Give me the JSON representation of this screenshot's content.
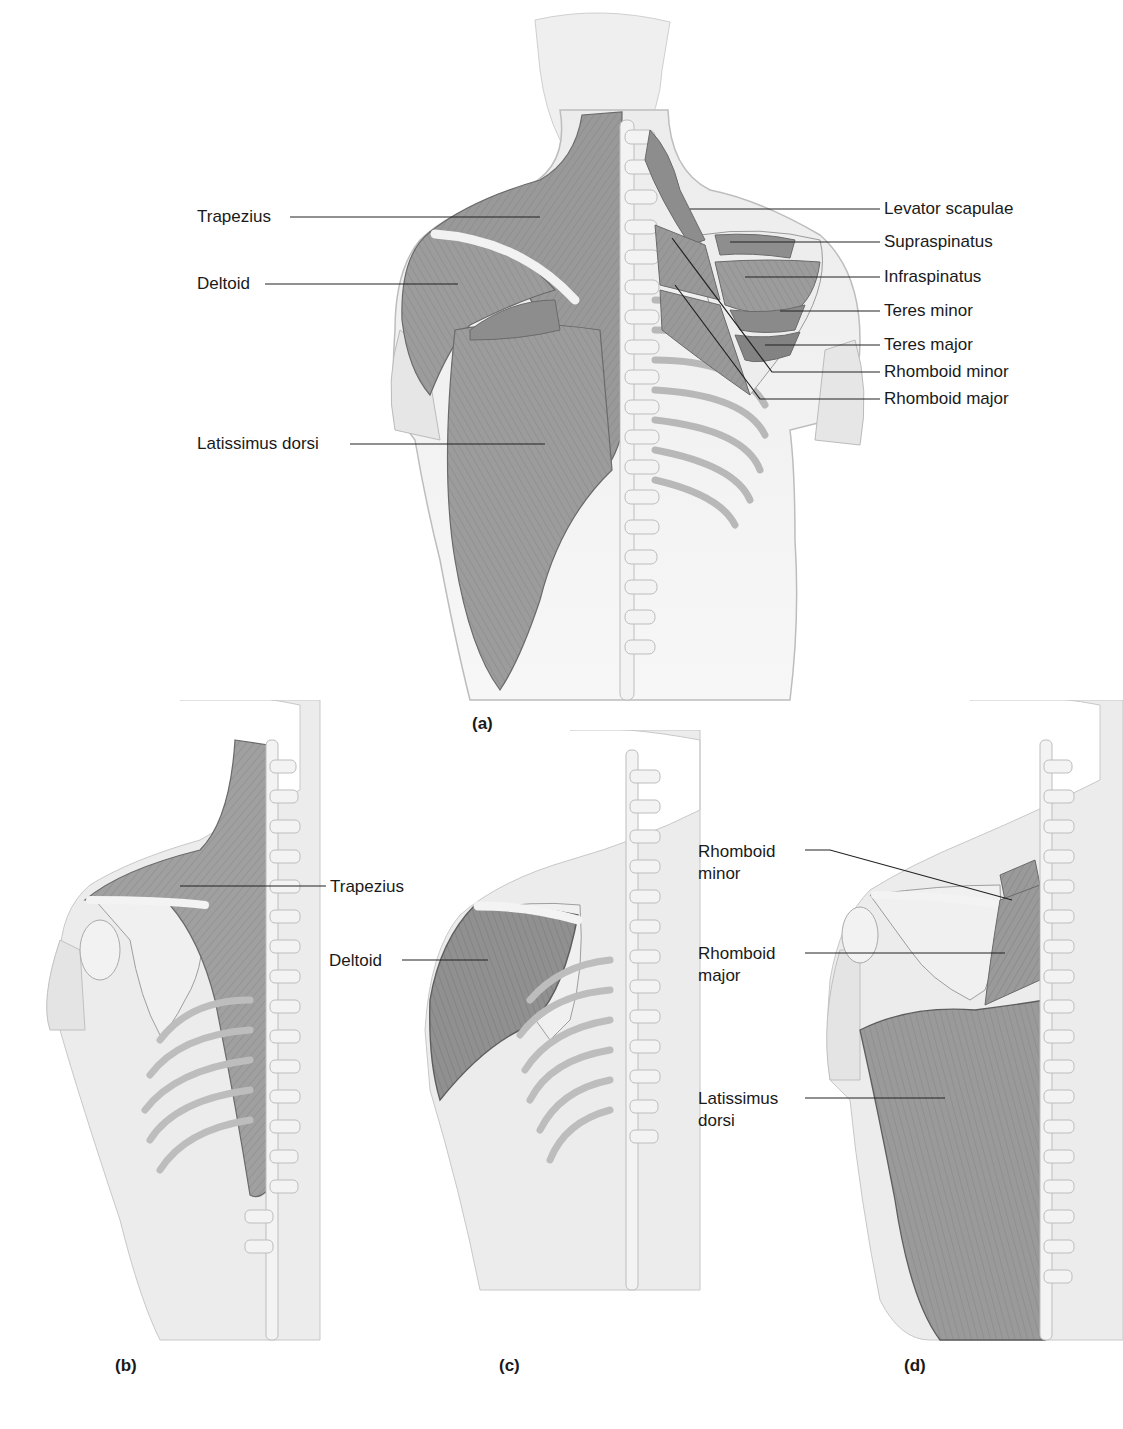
{
  "figure": {
    "panels": [
      {
        "id": "a",
        "caption": "(a)",
        "labels_left": [
          "Trapezius",
          "Deltoid",
          "Latissimus dorsi"
        ],
        "labels_right": [
          "Levator scapulae",
          "Supraspinatus",
          "Infraspinatus",
          "Teres minor",
          "Teres major",
          "Rhomboid minor",
          "Rhomboid major"
        ]
      },
      {
        "id": "b",
        "caption": "(b)",
        "labels": [
          "Trapezius"
        ]
      },
      {
        "id": "c",
        "caption": "(c)",
        "labels": [
          "Deltoid"
        ]
      },
      {
        "id": "d",
        "caption": "(d)",
        "labels": [
          {
            "line1": "Rhomboid",
            "line2": "minor"
          },
          {
            "line1": "Rhomboid",
            "line2": "major"
          },
          {
            "line1": "Latissimus",
            "line2": "dorsi"
          }
        ]
      }
    ],
    "colors": {
      "skin": "#e8e8e8",
      "muscle": "#9a9a9a",
      "muscle_dark": "#7c7c7c",
      "bone": "#f2f2f2",
      "outline": "#6a6a6a",
      "leader": "#222222"
    }
  }
}
